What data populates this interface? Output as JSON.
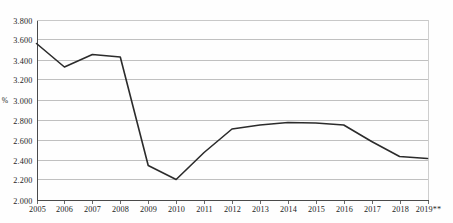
{
  "chart_data": {
    "type": "line",
    "title": "",
    "subtitle": "",
    "xlabel": "",
    "ylabel": "%",
    "ylim": [
      2.0,
      3.8
    ],
    "ytick_step": 0.2,
    "grid": true,
    "legend": "none",
    "y_ticks": [
      "2.000",
      "2.200",
      "2.400",
      "2.600",
      "2.800",
      "3.000",
      "3.200",
      "3.400",
      "3.600",
      "3.800"
    ],
    "y_tick_values": [
      2.0,
      2.2,
      2.4,
      2.6,
      2.8,
      3.0,
      3.2,
      3.4,
      3.6,
      3.8
    ],
    "categories": [
      "2005",
      "2006",
      "2007",
      "2008",
      "2009",
      "2010",
      "2011",
      "2012",
      "2013",
      "2014",
      "2015",
      "2016",
      "2017",
      "2018",
      "2019**"
    ],
    "values": [
      3.56,
      3.325,
      3.45,
      3.425,
      2.34,
      2.2,
      2.47,
      2.705,
      2.745,
      2.77,
      2.765,
      2.745,
      2.58,
      2.43,
      2.41
    ],
    "series": [
      {
        "name": "",
        "color": "#2b2b2b",
        "values": [
          3.56,
          3.325,
          3.45,
          3.425,
          2.34,
          2.2,
          2.47,
          2.705,
          2.745,
          2.77,
          2.765,
          2.745,
          2.58,
          2.43,
          2.41
        ]
      }
    ],
    "footnote_marker": "**",
    "colors": {
      "line": "#2b2b2b",
      "grid": "#b9b9b9",
      "axis": "#4a4a4a",
      "text": "#1d1d1d",
      "background": "#fefefe"
    }
  }
}
